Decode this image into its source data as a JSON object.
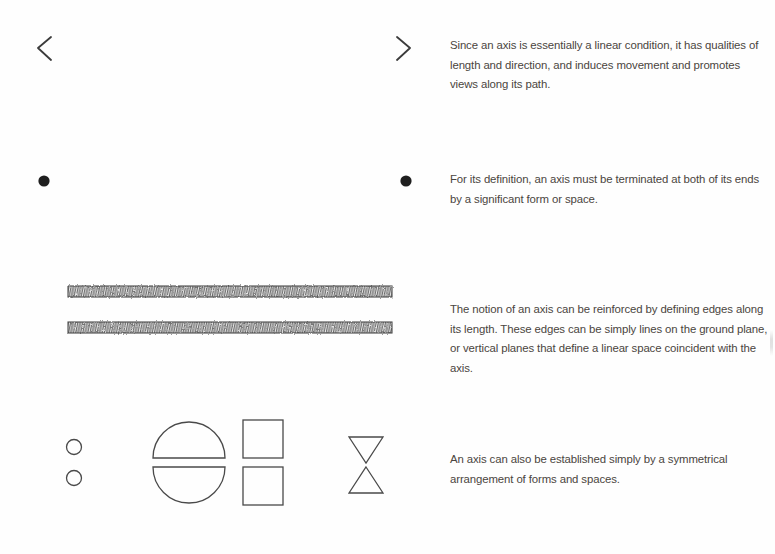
{
  "page": {
    "width": 775,
    "height": 554,
    "background": "#ffffff",
    "ink_color": "#3a3a3a",
    "text_color": "#4a4540"
  },
  "entries": [
    {
      "id": "axis-linear-condition",
      "figure_name": "double-headed-arrow-diagram",
      "caption": "Since an axis is essentially a linear condition, it has qualities of length and direction, and induces movement and promotes views along its path."
    },
    {
      "id": "axis-terminated-ends",
      "figure_name": "terminated-axis-diagram",
      "caption": "For its definition, an axis must be terminated at both of its ends by a significant form or space."
    },
    {
      "id": "axis-reinforced-edges",
      "figure_name": "edged-axis-diagram",
      "caption": "The notion of an axis can be reinforced by defining edges along its length. These edges can be simply lines on the ground plane, or vertical planes that define a linear space coincident with the axis."
    },
    {
      "id": "axis-symmetrical-arrangement",
      "figure_name": "symmetrical-forms-diagram",
      "caption": "An axis can also be established simply by a symmetrical arrangement of forms and spaces."
    }
  ],
  "figures": {
    "arrow": {
      "x_start": 38,
      "x_end": 410,
      "y": 48,
      "head_style": "open-chevron",
      "head_size": 13
    },
    "terminated": {
      "x_start": 44,
      "x_end": 406,
      "y": 181,
      "dot_radius": 5.5,
      "line_style": "dash-dot"
    },
    "edged": {
      "axis_x_start": 28,
      "axis_x_end": 420,
      "axis_y": 312,
      "band_x_start": 68,
      "band_x_end": 392,
      "band_height": 11,
      "band_top_y": 291,
      "band_bottom_y": 322,
      "band_fill": "hatched-scribble"
    },
    "symmetrical": {
      "axis_x_start": 40,
      "axis_x_end": 425,
      "axis_y": 462,
      "forms": [
        {
          "name": "circle-pair",
          "cx": 74,
          "size": 15
        },
        {
          "name": "semicircle-pair",
          "cx": 189,
          "size": 72
        },
        {
          "name": "square-pair",
          "cx": 263,
          "size": 40
        },
        {
          "name": "triangle-pair",
          "cx": 366,
          "size": 34
        }
      ]
    }
  }
}
